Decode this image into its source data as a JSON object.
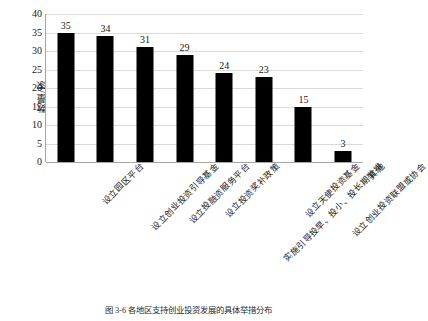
{
  "chart_data": {
    "type": "bar",
    "title": "",
    "xlabel": "",
    "ylabel": "数量/家",
    "ylim": [
      0,
      40
    ],
    "yticks": [
      0,
      5,
      10,
      15,
      20,
      25,
      30,
      35,
      40
    ],
    "grid": true,
    "legend": false,
    "bar_color": "#000000",
    "categories": [
      "设立园区平台",
      "设立创业投资引导基金",
      "设立投融资服务平台",
      "设立投资奖补政策",
      "实施引导投早、投小、投长期举措",
      "设立天使投资基金",
      "设立创业投资联盟或协会",
      "其他"
    ],
    "values": [
      35,
      34,
      31,
      29,
      24,
      23,
      15,
      3
    ],
    "data_labels": [
      "35",
      "34",
      "31",
      "29",
      "24",
      "23",
      "15",
      "3"
    ]
  },
  "caption": {
    "text": "图 3-6  各地区支持创业投资发展的具体举措分布"
  }
}
